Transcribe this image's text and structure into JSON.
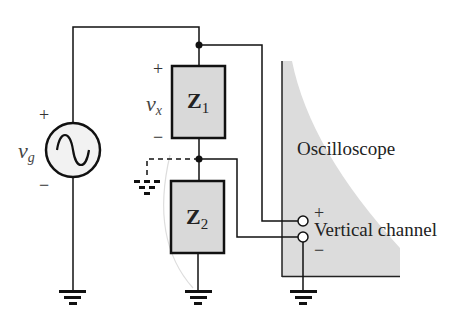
{
  "diagram": {
    "type": "circuit",
    "source": {
      "symbol": "v",
      "subscript": "g",
      "plus": "+",
      "minus": "−",
      "kind": "ac-sine"
    },
    "z1": {
      "symbol": "Z",
      "subscript": "1"
    },
    "z2": {
      "symbol": "Z",
      "subscript": "2"
    },
    "vx": {
      "symbol": "v",
      "subscript": "x",
      "plus": "+",
      "minus": "−"
    },
    "oscilloscope": {
      "label": "Oscilloscope",
      "channel_label": "Vertical channel",
      "plus": "+",
      "minus": "−"
    },
    "colors": {
      "wire": "#111111",
      "component_fill": "#d9d9d9",
      "scope_fill": "#dcdcdc",
      "faint_curve": "#dddddd"
    }
  }
}
